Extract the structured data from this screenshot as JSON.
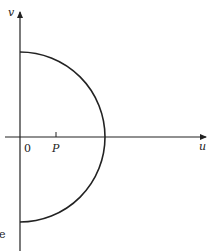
{
  "diagram": {
    "axes": {
      "horizontal_label": "u",
      "vertical_label": "v",
      "origin_label": "0"
    },
    "points": [
      {
        "label": "P",
        "position": "on u-axis, right of origin"
      }
    ],
    "curve": {
      "type": "semicircle",
      "description": "right half of circle centered at origin, spanning from positive v-axis to negative v-axis"
    },
    "edge_text": "e",
    "colors": {
      "stroke": "#222222",
      "background": "#ffffff"
    }
  }
}
